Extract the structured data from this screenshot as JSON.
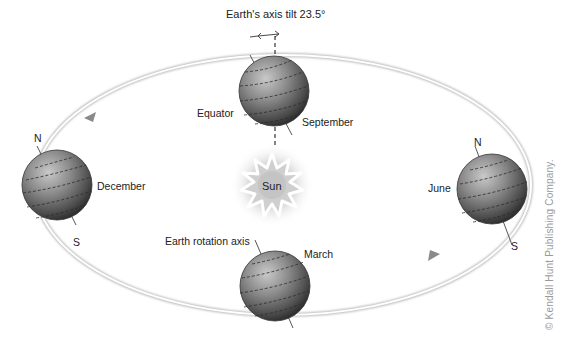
{
  "diagram": {
    "title_annotation": "Earth's axis tilt 23.5°",
    "sun_label": "Sun",
    "labels": {
      "equator": "Equator",
      "rotation_axis": "Earth rotation axis"
    },
    "earth_positions": [
      {
        "month": "September",
        "position": "top"
      },
      {
        "month": "December",
        "position": "left",
        "north": "N",
        "south": "S"
      },
      {
        "month": "March",
        "position": "bottom"
      },
      {
        "month": "June",
        "position": "right",
        "north": "N",
        "south": "S"
      }
    ],
    "orbit": {
      "direction": "counterclockwise-arrows",
      "arrows": 2
    },
    "copyright": "© Kendall Hunt Publishing Company.",
    "colors": {
      "globe_dark": "#3a3a3a",
      "globe_mid": "#7a7a7a",
      "globe_light": "#b5b5b5",
      "orbit_line": "#c8c8c8",
      "sun_glow": "#d6d6d6"
    }
  }
}
